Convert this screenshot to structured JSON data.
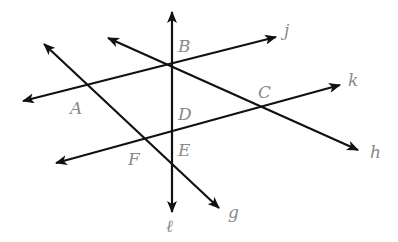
{
  "diagram": {
    "type": "geometry-lines",
    "colors": {
      "line": "#111111",
      "label": "#8a8a8a",
      "background": "#ffffff"
    },
    "lines": [
      {
        "id": "l",
        "label": "ℓ",
        "x1": 172,
        "y1": 12,
        "x2": 172,
        "y2": 212,
        "arrows": "both",
        "label_x": 166,
        "label_y": 232
      },
      {
        "id": "j",
        "label": "j",
        "x1": 23,
        "y1": 101,
        "x2": 276,
        "y2": 37,
        "arrows": "both",
        "label_x": 284,
        "label_y": 36
      },
      {
        "id": "h",
        "label": "h",
        "x1": 108,
        "y1": 38,
        "x2": 358,
        "y2": 150,
        "arrows": "both",
        "label_x": 370,
        "label_y": 158
      },
      {
        "id": "g",
        "label": "g",
        "x1": 44,
        "y1": 44,
        "x2": 219,
        "y2": 208,
        "arrows": "both",
        "label_x": 228,
        "label_y": 218
      },
      {
        "id": "k",
        "label": "k",
        "x1": 56,
        "y1": 163,
        "x2": 340,
        "y2": 85,
        "arrows": "both",
        "label_x": 348,
        "label_y": 86
      }
    ],
    "points": [
      {
        "label": "A",
        "x": 88,
        "y": 87,
        "label_x": 70,
        "label_y": 114
      },
      {
        "label": "B",
        "x": 172,
        "y": 64,
        "label_x": 178,
        "label_y": 52
      },
      {
        "label": "C",
        "x": 262,
        "y": 108,
        "label_x": 258,
        "label_y": 98
      },
      {
        "label": "D",
        "x": 172,
        "y": 132,
        "label_x": 178,
        "label_y": 120
      },
      {
        "label": "E",
        "x": 172,
        "y": 163,
        "label_x": 178,
        "label_y": 156
      },
      {
        "label": "F",
        "x": 145,
        "y": 140,
        "label_x": 128,
        "label_y": 165
      }
    ]
  }
}
